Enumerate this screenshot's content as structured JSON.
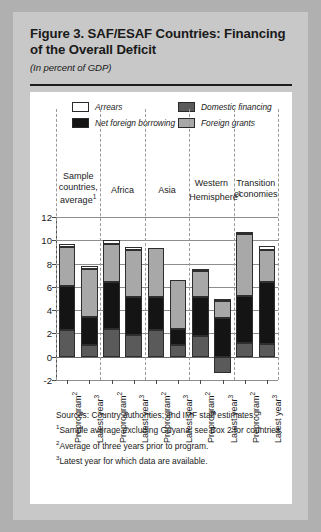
{
  "figure": {
    "title": "Figure 3.  SAF/ESAF Countries: Financing of the Overall Deficit",
    "subtitle": "(In percent of GDP)"
  },
  "notes": {
    "sources": "Sources:  Country authorities; and IMF staff estimates.",
    "note1": "Sample average excluding Guyana; see Box 2 for countries.",
    "note2": "Average of three years prior to program.",
    "note3": "Latest year for which data are available.",
    "marker1": "1",
    "marker2": "2",
    "marker3": "3"
  },
  "chart_data": {
    "type": "bar",
    "title": "Figure 3.  SAF/ESAF Countries: Financing of the Overall Deficit",
    "subtitle": "(In percent of GDP)",
    "xlabel": "",
    "ylabel": "",
    "ylim": [
      -2,
      12
    ],
    "yticks": [
      -2,
      0,
      2,
      4,
      6,
      8,
      10,
      12
    ],
    "ytick_labels": [
      "-2",
      "0",
      "2",
      "4",
      "6",
      "8",
      "10",
      "12"
    ],
    "grid": true,
    "stacked": true,
    "legend_position": "top",
    "legend": [
      {
        "label": "Arrears",
        "color": "#ffffff"
      },
      {
        "label": "Net foreign borrowing",
        "color": "#141414"
      },
      {
        "label": "Domestic financing",
        "color": "#5a5a5a"
      },
      {
        "label": "Foreign grants",
        "color": "#a8a8a8"
      }
    ],
    "groups": [
      {
        "label": "Sample countries, average",
        "footnote": "1"
      },
      {
        "label": "Africa",
        "footnote": ""
      },
      {
        "label": "Asia",
        "footnote": ""
      },
      {
        "label": "Western Hemisphere",
        "footnote": "1"
      },
      {
        "label": "Transition economies",
        "footnote": ""
      }
    ],
    "categories": [
      "Preprogram",
      "Latest year",
      "Preprogram",
      "Latest year",
      "Preprogram",
      "Latest year",
      "Preprogram",
      "Latest year",
      "Preprogram",
      "Latest year"
    ],
    "category_footnotes": [
      "2",
      "3",
      "2",
      "3",
      "2",
      "3",
      "2",
      "3",
      "2",
      "3"
    ],
    "series": [
      {
        "name": "Domestic financing",
        "values": [
          2.3,
          1.0,
          2.4,
          1.9,
          2.3,
          1.0,
          1.8,
          -1.4,
          1.2,
          1.1
        ]
      },
      {
        "name": "Net foreign borrowing",
        "values": [
          3.8,
          2.4,
          4.0,
          3.2,
          2.8,
          1.4,
          3.3,
          3.3,
          4.0,
          5.3
        ]
      },
      {
        "name": "Foreign grants",
        "values": [
          3.3,
          4.1,
          3.3,
          4.1,
          4.2,
          4.2,
          2.3,
          1.5,
          5.3,
          2.8
        ]
      },
      {
        "name": "Arrears",
        "values": [
          0.3,
          0.3,
          0.3,
          0.2,
          0.0,
          0.0,
          0.1,
          0.2,
          0.2,
          0.3
        ]
      }
    ],
    "totals": [
      9.7,
      7.8,
      10.0,
      9.4,
      9.3,
      6.6,
      7.5,
      3.6,
      10.7,
      9.5
    ]
  }
}
